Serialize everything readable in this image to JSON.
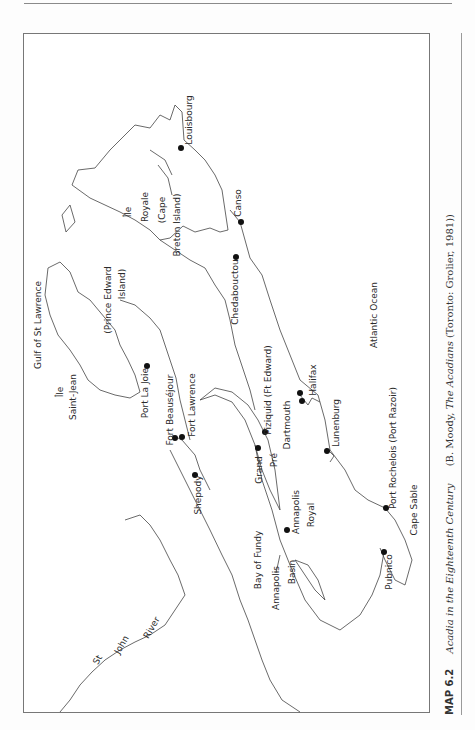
{
  "caption": {
    "number": "MAP 6.2",
    "title": "Acadia in the Eighteenth Century",
    "source_prefix": "(B. Moody, ",
    "source_book": "The Acadians",
    "source_suffix": " (Toronto: Grolier, 1981))"
  },
  "labels": {
    "gulf": "Gulf of St Lawrence",
    "ile_saint_jean_1": "Île",
    "ile_saint_jean_2": "Saint-Jean",
    "pei_1": "(Prince Edward",
    "pei_2": "Island)",
    "ile_royale_1": "Île",
    "ile_royale_2": "Royale",
    "ile_royale_3": "(Cape",
    "ile_royale_4": "Breton Island)",
    "louisbourg": "Louisbourg",
    "canso": "Canso",
    "chedabouctou": "Chedabouctou",
    "port_la_joie": "Port La Joie",
    "fort_beausejour": "Fort Beauséjour",
    "fort_lawrence": "Fort Lawrence",
    "shepody": "Shepody",
    "piziquid": "Piziquid (Ft Edward)",
    "grand": "Grand",
    "pre": "Pré",
    "dartmouth": "Dartmouth",
    "halifax": "Halifax",
    "lunenburg": "Lunenburg",
    "port_rochelois": "Port Rochelois (Port Razoir)",
    "atlantic": "Atlantic Ocean",
    "bay_of_fundy": "Bay of Fundy",
    "annapolis_royal_1": "Annapolis",
    "annapolis_royal_2": "Royal",
    "annapolis_basin_1": "Annapolis",
    "annapolis_basin_2": "Basin",
    "pubnico": "Pubnico",
    "cape_sable": "Cape Sable",
    "st": "St",
    "john": "John",
    "river": "River"
  }
}
